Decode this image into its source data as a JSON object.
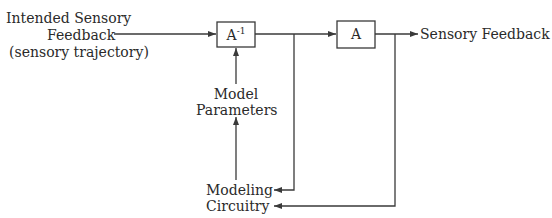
{
  "diagram": {
    "input_label": {
      "line1": "Intended Sensory",
      "line2": "Feedback",
      "line3": "(sensory trajectory)"
    },
    "inverse_model_box": {
      "base": "A",
      "superscript": "-1"
    },
    "plant_box": {
      "label": "A"
    },
    "output_label": "Sensory Feedback",
    "model_parameters": {
      "line1": "Model",
      "line2": "Parameters"
    },
    "modeling_circuitry": {
      "line1": "Modeling",
      "line2": "Circuitry"
    },
    "colors": {
      "stroke": "#3a3a3a",
      "text": "#2a2a2a",
      "background": "#ffffff"
    }
  }
}
